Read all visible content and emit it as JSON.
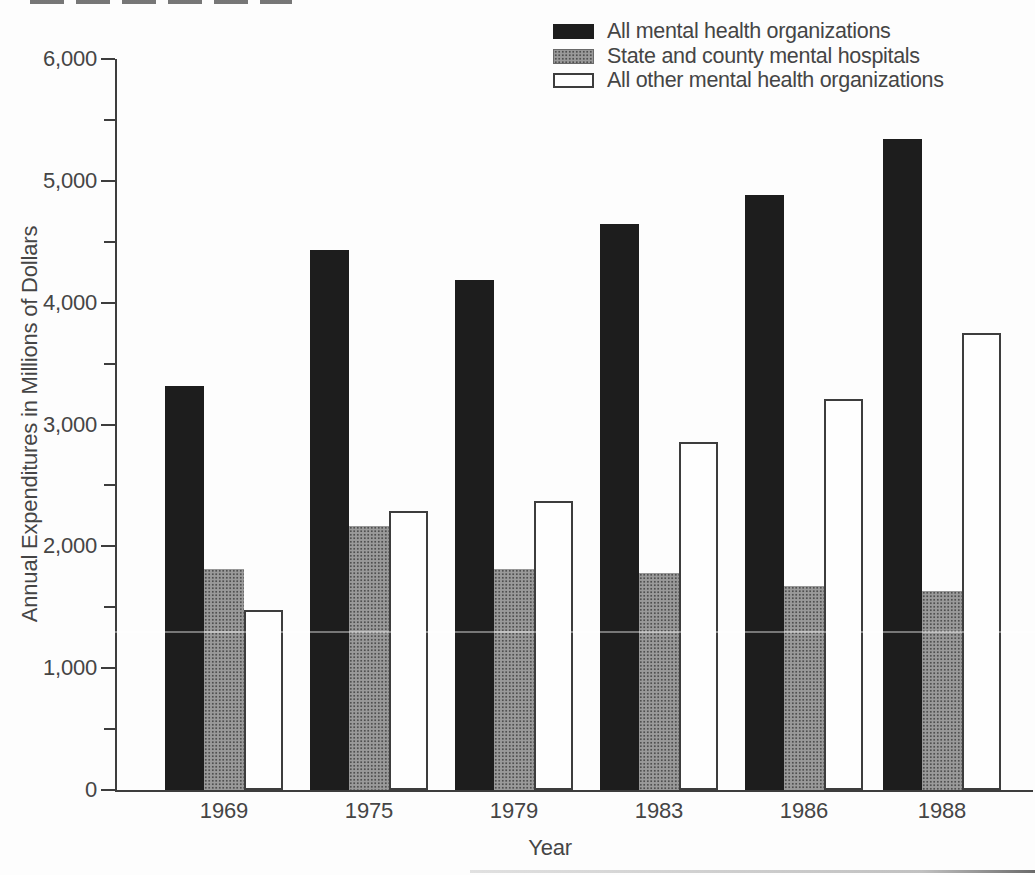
{
  "chart_data": {
    "type": "bar",
    "title": "",
    "xlabel": "Year",
    "ylabel": "Annual Expenditures in Millions of Dollars",
    "categories": [
      "1969",
      "1975",
      "1979",
      "1983",
      "1986",
      "1988"
    ],
    "series": [
      {
        "name": "All mental health organizations",
        "style": "black",
        "values": [
          3320,
          4430,
          4190,
          4645,
          4885,
          5340
        ]
      },
      {
        "name": "State and county mental hospitals",
        "style": "gray",
        "values": [
          1815,
          2170,
          1810,
          1780,
          1675,
          1630
        ]
      },
      {
        "name": "All other mental health organizations",
        "style": "white",
        "values": [
          1475,
          2290,
          2375,
          2855,
          3210,
          3750
        ]
      }
    ],
    "ylim": [
      0,
      6000
    ],
    "ytick_major": 1000,
    "ytick_minor": 500,
    "ytick_labels": [
      "0",
      "1,000",
      "2,000",
      "3,000",
      "4,000",
      "5,000",
      "6,000"
    ],
    "legend_position": "top-right",
    "grid": false
  },
  "colors": {
    "bar_black": "#1d1d1d",
    "bar_gray": "#9a9a9a",
    "bar_white": "#fefefe",
    "bar_outline": "#3d3d3d",
    "axis": "#3d3d3d",
    "text": "#454545",
    "background": "#fdfdfd"
  }
}
